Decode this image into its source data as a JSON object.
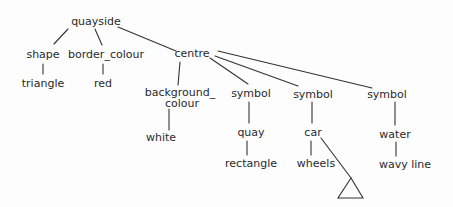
{
  "diagram": {
    "type": "tree",
    "nodes": {
      "root": "quayside",
      "shape": "shape",
      "triangle": "triangle",
      "border_colour": "border_colour",
      "red": "red",
      "centre": "centre",
      "background_colour_1": "background_",
      "background_colour_2": "colour",
      "white": "white",
      "symbol1": "symbol",
      "quay": "quay",
      "rectangle": "rectangle",
      "symbol2": "symbol",
      "car": "car",
      "wheels": "wheels",
      "symbol3": "symbol",
      "water": "water",
      "wavy_line": "wavy line"
    },
    "edges": [
      [
        "quayside",
        "shape"
      ],
      [
        "quayside",
        "border_colour"
      ],
      [
        "quayside",
        "centre"
      ],
      [
        "shape",
        "triangle"
      ],
      [
        "border_colour",
        "red"
      ],
      [
        "centre",
        "background_colour"
      ],
      [
        "centre",
        "symbol"
      ],
      [
        "centre",
        "symbol"
      ],
      [
        "centre",
        "symbol"
      ],
      [
        "background_colour",
        "white"
      ],
      [
        "symbol",
        "quay"
      ],
      [
        "quay",
        "rectangle"
      ],
      [
        "symbol",
        "car"
      ],
      [
        "car",
        "wheels"
      ],
      [
        "car",
        "triangle-glyph"
      ],
      [
        "symbol",
        "water"
      ],
      [
        "water",
        "wavy line"
      ]
    ]
  }
}
